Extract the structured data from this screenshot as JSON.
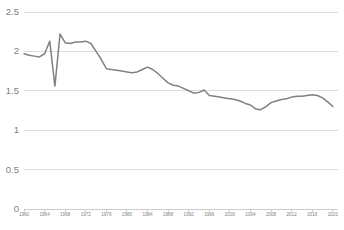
{
  "chart_data": {
    "type": "line",
    "title": "",
    "subtitle": "",
    "xlabel": "",
    "ylabel": "",
    "grid": true,
    "legend": false,
    "legend_position": "none",
    "line_color": "#808080",
    "gridline_color": "#d4d4d4",
    "axis_color": "#bfbfbf",
    "tick_label_color": "#7f7f7f",
    "background_color": "#ffffff",
    "xlim": [
      1960,
      2021
    ],
    "ylim": [
      0,
      2.5
    ],
    "yticks": [
      0,
      0.5,
      1,
      1.5,
      2,
      2.5
    ],
    "ytick_labels": [
      "0",
      "0.5",
      "1",
      "1.5",
      "2",
      "2.5"
    ],
    "xticks": [
      1960,
      1964,
      1968,
      1972,
      1976,
      1980,
      1984,
      1988,
      1992,
      1996,
      2000,
      2004,
      2008,
      2012,
      2016,
      2020
    ],
    "xtick_labels": [
      "1960",
      "1964",
      "1968",
      "1972",
      "1976",
      "1980",
      "1984",
      "1988",
      "1992",
      "1996",
      "2000",
      "2004",
      "2008",
      "2012",
      "2016",
      "2020"
    ],
    "x": [
      1960,
      1961,
      1962,
      1963,
      1964,
      1965,
      1966,
      1967,
      1968,
      1969,
      1970,
      1971,
      1972,
      1973,
      1974,
      1975,
      1976,
      1977,
      1978,
      1979,
      1980,
      1981,
      1982,
      1983,
      1984,
      1985,
      1986,
      1987,
      1988,
      1989,
      1990,
      1991,
      1992,
      1993,
      1994,
      1995,
      1996,
      1997,
      1998,
      1999,
      2000,
      2001,
      2002,
      2003,
      2004,
      2005,
      2006,
      2007,
      2008,
      2009,
      2010,
      2011,
      2012,
      2013,
      2014,
      2015,
      2016,
      2017,
      2018,
      2019,
      2020
    ],
    "values": [
      1.97,
      1.95,
      1.94,
      1.93,
      1.97,
      2.13,
      1.56,
      2.22,
      2.11,
      2.1,
      2.12,
      2.12,
      2.13,
      2.1,
      2.0,
      1.9,
      1.78,
      1.77,
      1.76,
      1.75,
      1.74,
      1.73,
      1.74,
      1.77,
      1.8,
      1.77,
      1.72,
      1.66,
      1.6,
      1.57,
      1.56,
      1.53,
      1.5,
      1.47,
      1.48,
      1.51,
      1.44,
      1.43,
      1.42,
      1.41,
      1.4,
      1.39,
      1.37,
      1.34,
      1.32,
      1.27,
      1.26,
      1.3,
      1.35,
      1.37,
      1.39,
      1.4,
      1.42,
      1.43,
      1.43,
      1.44,
      1.45,
      1.44,
      1.41,
      1.36,
      1.3
    ],
    "series": [
      {
        "name": "series-1",
        "color": "#808080",
        "values": [
          1.97,
          1.95,
          1.94,
          1.93,
          1.97,
          2.13,
          1.56,
          2.22,
          2.11,
          2.1,
          2.12,
          2.12,
          2.13,
          2.1,
          2.0,
          1.9,
          1.78,
          1.77,
          1.76,
          1.75,
          1.74,
          1.73,
          1.74,
          1.77,
          1.8,
          1.77,
          1.72,
          1.66,
          1.6,
          1.57,
          1.56,
          1.53,
          1.5,
          1.47,
          1.48,
          1.51,
          1.44,
          1.43,
          1.42,
          1.41,
          1.4,
          1.39,
          1.37,
          1.34,
          1.32,
          1.27,
          1.26,
          1.3,
          1.35,
          1.37,
          1.39,
          1.4,
          1.42,
          1.43,
          1.43,
          1.44,
          1.45,
          1.44,
          1.41,
          1.36,
          1.3
        ]
      }
    ],
    "annotations": []
  },
  "layout": {
    "plot_left": 24,
    "plot_right": 338,
    "plot_top": 12,
    "plot_bottom": 209,
    "width": 344,
    "height": 230
  }
}
